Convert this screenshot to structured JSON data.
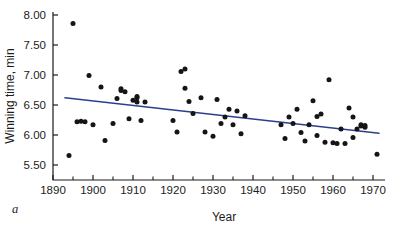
{
  "figure": {
    "panel_letter": "a"
  },
  "chart_data": {
    "type": "scatter",
    "title": "",
    "xlabel": "Year",
    "ylabel": "Winning time, min",
    "xlim": [
      1890,
      1973
    ],
    "ylim": [
      5.25,
      8.05
    ],
    "grid": false,
    "legend": "none",
    "x_ticks": [
      1890,
      1900,
      1910,
      1920,
      1930,
      1940,
      1950,
      1960,
      1970
    ],
    "x_tick_labels": [
      "1890",
      "1900",
      "1910",
      "1920",
      "1930",
      "1940",
      "1950",
      "1960",
      "1970"
    ],
    "x_minor_ticks": [
      1895,
      1905,
      1915,
      1925,
      1935,
      1945,
      1955,
      1965
    ],
    "y_ticks": [
      5.5,
      6.0,
      6.5,
      7.0,
      7.5,
      8.0
    ],
    "y_tick_labels": [
      "5.50",
      "6.00",
      "6.50",
      "7.00",
      "7.50",
      "8.00"
    ],
    "series": [
      {
        "name": "Winning time",
        "marker": "filled-circle",
        "color": "#151515",
        "points": [
          [
            1894,
            5.66
          ],
          [
            1895,
            7.86
          ],
          [
            1896,
            6.22
          ],
          [
            1897,
            6.23
          ],
          [
            1898,
            6.22
          ],
          [
            1899,
            6.99
          ],
          [
            1900,
            6.17
          ],
          [
            1902,
            6.8
          ],
          [
            1903,
            5.91
          ],
          [
            1905,
            6.19
          ],
          [
            1906,
            6.61
          ],
          [
            1907,
            6.74
          ],
          [
            1907,
            6.77
          ],
          [
            1908,
            6.72
          ],
          [
            1909,
            6.27
          ],
          [
            1910,
            6.58
          ],
          [
            1911,
            6.62
          ],
          [
            1911,
            6.55
          ],
          [
            1911,
            6.64
          ],
          [
            1912,
            6.24
          ],
          [
            1913,
            6.55
          ],
          [
            1920,
            6.24
          ],
          [
            1921,
            6.05
          ],
          [
            1922,
            7.06
          ],
          [
            1923,
            7.1
          ],
          [
            1923,
            6.78
          ],
          [
            1924,
            6.56
          ],
          [
            1925,
            6.36
          ],
          [
            1927,
            6.62
          ],
          [
            1928,
            6.05
          ],
          [
            1930,
            5.98
          ],
          [
            1931,
            6.59
          ],
          [
            1932,
            6.19
          ],
          [
            1933,
            6.3
          ],
          [
            1934,
            6.43
          ],
          [
            1935,
            6.17
          ],
          [
            1936,
            6.4
          ],
          [
            1937,
            6.02
          ],
          [
            1938,
            6.32
          ],
          [
            1947,
            6.17
          ],
          [
            1948,
            5.94
          ],
          [
            1949,
            6.3
          ],
          [
            1950,
            6.19
          ],
          [
            1951,
            6.43
          ],
          [
            1952,
            6.04
          ],
          [
            1953,
            5.9
          ],
          [
            1954,
            6.17
          ],
          [
            1955,
            6.57
          ],
          [
            1956,
            6.31
          ],
          [
            1956,
            5.99
          ],
          [
            1957,
            6.35
          ],
          [
            1958,
            5.88
          ],
          [
            1959,
            6.92
          ],
          [
            1960,
            5.87
          ],
          [
            1961,
            5.86
          ],
          [
            1962,
            6.1
          ],
          [
            1963,
            5.86
          ],
          [
            1964,
            6.45
          ],
          [
            1965,
            6.3
          ],
          [
            1965,
            5.96
          ],
          [
            1966,
            6.1
          ],
          [
            1967,
            6.15
          ],
          [
            1967,
            6.17
          ],
          [
            1968,
            6.13
          ],
          [
            1968,
            6.16
          ],
          [
            1971,
            5.68
          ]
        ]
      }
    ],
    "trend_line": {
      "name": "least-squares fit",
      "color": "#2b3f8c",
      "x_start": 1893,
      "y_start": 6.62,
      "x_end": 1971.5,
      "y_end": 6.03
    }
  }
}
